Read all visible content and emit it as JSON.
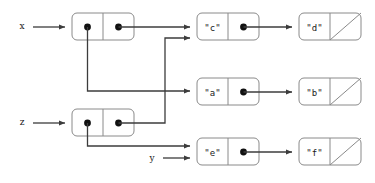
{
  "diagram": {
    "kind": "cons-cell box-and-pointer diagram",
    "background_color": "#ffffff",
    "box_stroke_color": "#8a8a8a",
    "pointer_color": "#3c3c3c",
    "dot_color": "#111111",
    "variables": [
      {
        "name": "x",
        "label": "x",
        "x": 22,
        "y": 29
      },
      {
        "name": "z",
        "label": "z",
        "x": 22,
        "y": 125
      },
      {
        "name": "y",
        "label": "y",
        "x": 152,
        "y": 161
      }
    ],
    "cells": [
      {
        "id": "x-cons",
        "car_label": "",
        "cdr_label": "",
        "car_kind": "pointer-dot",
        "cdr_kind": "pointer-dot",
        "x": 72,
        "y": 13,
        "w": 62,
        "h": 27
      },
      {
        "id": "z-cons",
        "car_label": "",
        "cdr_label": "",
        "car_kind": "pointer-dot",
        "cdr_kind": "pointer-dot",
        "x": 72,
        "y": 109,
        "w": 62,
        "h": 27
      },
      {
        "id": "c-cons",
        "car_label": "\"c\"",
        "cdr_label": "",
        "car_kind": "atom",
        "cdr_kind": "pointer-dot",
        "x": 197,
        "y": 13,
        "w": 62,
        "h": 27
      },
      {
        "id": "d-cons",
        "car_label": "\"d\"",
        "cdr_label": "",
        "car_kind": "atom",
        "cdr_kind": "nil-slash",
        "x": 299,
        "y": 13,
        "w": 62,
        "h": 27
      },
      {
        "id": "a-cons",
        "car_label": "\"a\"",
        "cdr_label": "",
        "car_kind": "atom",
        "cdr_kind": "pointer-dot",
        "x": 197,
        "y": 78,
        "w": 62,
        "h": 27
      },
      {
        "id": "b-cons",
        "car_label": "\"b\"",
        "cdr_label": "",
        "car_kind": "atom",
        "cdr_kind": "nil-slash",
        "x": 299,
        "y": 78,
        "w": 62,
        "h": 27
      },
      {
        "id": "e-cons",
        "car_label": "\"e\"",
        "cdr_label": "",
        "car_kind": "atom",
        "cdr_kind": "pointer-dot",
        "x": 197,
        "y": 138,
        "w": 62,
        "h": 27
      },
      {
        "id": "f-cons",
        "car_label": "\"f\"",
        "cdr_label": "",
        "car_kind": "atom",
        "cdr_kind": "nil-slash",
        "x": 299,
        "y": 138,
        "w": 62,
        "h": 27
      }
    ],
    "atom_labels": {
      "c": "\"c\"",
      "d": "\"d\"",
      "a": "\"a\"",
      "b": "\"b\"",
      "e": "\"e\"",
      "f": "\"f\""
    },
    "edges": [
      {
        "name": "x-var-to-x-cons",
        "from": "x",
        "to": "x-cons"
      },
      {
        "name": "z-var-to-z-cons",
        "from": "z",
        "to": "z-cons"
      },
      {
        "name": "y-var-to-e-cons",
        "from": "y",
        "to": "e-cons"
      },
      {
        "name": "x-car-to-a-cons",
        "from": "x-cons.car",
        "to": "a-cons"
      },
      {
        "name": "x-cdr-to-c-cons",
        "from": "x-cons.cdr",
        "to": "c-cons"
      },
      {
        "name": "z-car-to-e-cons",
        "from": "z-cons.car",
        "to": "e-cons"
      },
      {
        "name": "z-cdr-to-c-cons",
        "from": "z-cons.cdr",
        "to": "c-cons"
      },
      {
        "name": "c-cdr-to-d-cons",
        "from": "c-cons.cdr",
        "to": "d-cons"
      },
      {
        "name": "a-cdr-to-b-cons",
        "from": "a-cons.cdr",
        "to": "b-cons"
      },
      {
        "name": "e-cdr-to-f-cons",
        "from": "e-cons.cdr",
        "to": "f-cons"
      }
    ]
  }
}
